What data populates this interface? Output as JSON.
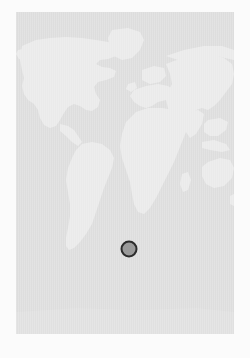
{
  "app": {
    "title": "World Map Location Picker",
    "background_color": "#fbfbfb"
  },
  "map": {
    "name": "world-map",
    "projection": "equirectangular",
    "panel": {
      "x": 16,
      "y": 12,
      "width": 218,
      "height": 322
    },
    "colors": {
      "ocean": "#dddddd",
      "land": "#eaeaea",
      "land_shadow": "#e3e3e3",
      "panel_border": "#dedede",
      "page_background": "#fbfbfb",
      "marker_fill": "#9a9a9a",
      "marker_ring": "#2c2c2c"
    },
    "continents": [
      {
        "name": "north-america",
        "label": "North America"
      },
      {
        "name": "greenland",
        "label": "Greenland"
      },
      {
        "name": "south-america",
        "label": "South America"
      },
      {
        "name": "europe",
        "label": "Europe"
      },
      {
        "name": "africa",
        "label": "Africa"
      },
      {
        "name": "asia",
        "label": "Asia"
      },
      {
        "name": "australia",
        "label": "Australia"
      }
    ]
  },
  "marker": {
    "name": "location-marker",
    "label": "",
    "x_px": 129,
    "y_px": 249,
    "radius_px": 8.5,
    "ring_width_px": 2.5,
    "fill_color": "#9a9a9a",
    "ring_color": "#2c2c2c",
    "region": "South Atlantic Ocean"
  }
}
